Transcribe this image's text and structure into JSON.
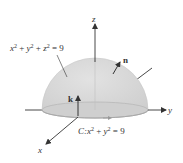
{
  "diagram": {
    "type": "hemisphere-surface-stokes",
    "colors": {
      "hemisphere_fill": "#d6d6d6",
      "hemisphere_edge": "#c4c4c4",
      "base_fill": "#cccccc",
      "axis": "#333333",
      "text": "#333333"
    },
    "axes": {
      "x_label": "x",
      "y_label": "y",
      "z_label": "z"
    },
    "surface_label": {
      "lhs_x": "x",
      "lhs_y": "y",
      "lhs_z": "z",
      "exp": "2",
      "plus": " + ",
      "eq": " = 9"
    },
    "curve_label": {
      "prefix": "C:",
      "x": "x",
      "y": "y",
      "exp": "2",
      "plus": " + ",
      "eq": " = 9"
    },
    "vectors": {
      "normal_label": "n",
      "k_label": "k"
    }
  }
}
